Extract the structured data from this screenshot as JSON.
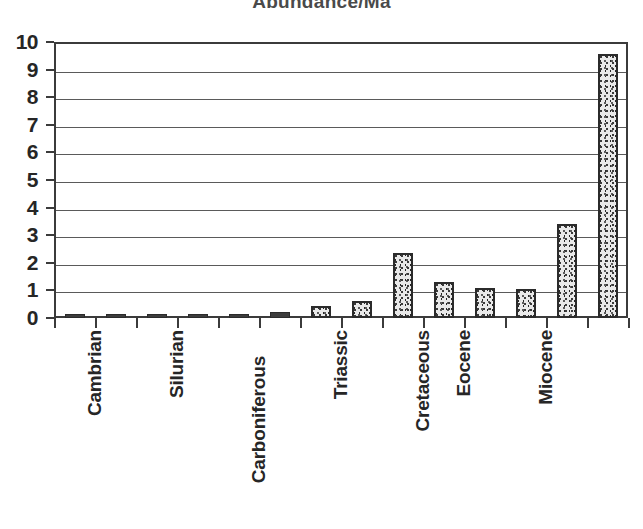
{
  "chart_data": {
    "type": "bar",
    "title": "Abundance/Ma",
    "xlabel": "",
    "ylabel": "",
    "ylim": [
      0,
      10
    ],
    "yticks": [
      0,
      1,
      2,
      3,
      4,
      5,
      6,
      7,
      8,
      9,
      10
    ],
    "ytick_labels": [
      "0",
      "1",
      "2",
      "3",
      "4",
      "5",
      "6",
      "7",
      "8",
      "9",
      "10"
    ],
    "grid": true,
    "legend": "none",
    "n_bars": 12,
    "categories": [
      "Cambrian",
      "",
      "Silurian",
      "",
      "Carboniferous",
      "",
      "Triassic",
      "",
      "Cretaceous",
      "",
      "Eocene",
      "",
      "Miocene",
      ""
    ],
    "visible_tick_labels": [
      {
        "index": 0,
        "label": "Cambrian"
      },
      {
        "index": 2,
        "label": "Silurian"
      },
      {
        "index": 4,
        "label": "Carboniferous"
      },
      {
        "index": 6,
        "label": "Triassic"
      },
      {
        "index": 8,
        "label": "Cretaceous"
      },
      {
        "index": 9,
        "label": "Eocene"
      },
      {
        "index": 11,
        "label": "Miocene"
      }
    ],
    "values": [
      0.08,
      0.04,
      0.08,
      0.08,
      0.08,
      0.2,
      0.45,
      0.6,
      2.35,
      1.3,
      1.15,
      1.1,
      3.4,
      9.55
    ],
    "bars": [
      {
        "index": 0,
        "label": "Cambrian",
        "value": 0.08
      },
      {
        "index": 1,
        "label": "",
        "value": 0.04
      },
      {
        "index": 2,
        "label": "Silurian",
        "value": 0.08
      },
      {
        "index": 3,
        "label": "",
        "value": 0.08
      },
      {
        "index": 4,
        "label": "Carboniferous",
        "value": 0.08
      },
      {
        "index": 5,
        "label": "",
        "value": 0.2
      },
      {
        "index": 6,
        "label": "Triassic",
        "value": 0.45
      },
      {
        "index": 7,
        "label": "",
        "value": 0.6
      },
      {
        "index": 8,
        "label": "Cretaceous",
        "value": 2.35
      },
      {
        "index": 9,
        "label": "Eocene",
        "value": 1.3
      },
      {
        "index": 10,
        "label": "",
        "value": 1.1
      },
      {
        "index": 11,
        "label": "Miocene",
        "value": 1.05
      },
      {
        "index": 12,
        "label": "",
        "value": 3.4
      },
      {
        "index": 13,
        "label": "",
        "value": 9.55
      }
    ],
    "colors": {
      "bar_fill": "#e9e9e9",
      "bar_speckle": "#3a3a3a",
      "bar_border": "#2b2b2b",
      "gridline": "#5a5a5a",
      "axis": "#3b3b3b",
      "text": "#262626",
      "title": "#4a4a4a",
      "background": "#ffffff"
    }
  }
}
